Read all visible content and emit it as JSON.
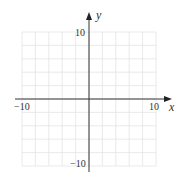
{
  "chart_data": {
    "type": "scatter",
    "title": "",
    "xlabel": "x",
    "ylabel": "y",
    "xlim": [
      -10,
      10
    ],
    "ylim": [
      -10,
      10
    ],
    "grid": true,
    "grid_step": 2,
    "x_tick_labels": [
      "-10",
      "10"
    ],
    "y_tick_labels": [
      "10",
      "-10"
    ],
    "series": [],
    "colors": {
      "axis": "#333333",
      "grid": "#e4e4e4",
      "background": "#ffffff"
    }
  },
  "labels": {
    "x_axis": "x",
    "y_axis": "y",
    "x_min": "−10",
    "x_max": "10",
    "y_max": "10",
    "y_min": "−10"
  }
}
